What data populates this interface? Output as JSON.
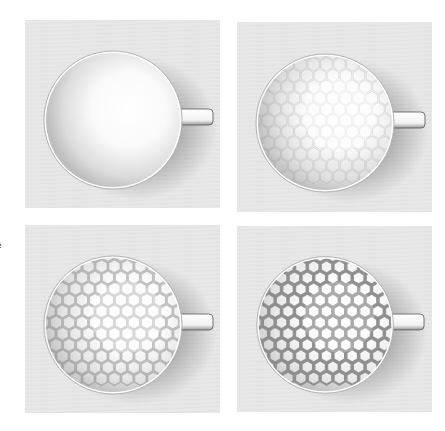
{
  "figure": {
    "edge_text_fragment": "e",
    "panels": [
      {
        "id": "plain",
        "pattern_strength": 0.0
      },
      {
        "id": "faint-hex",
        "pattern_strength": 0.25
      },
      {
        "id": "medium-hex",
        "pattern_strength": 0.55
      },
      {
        "id": "strong-hex",
        "pattern_strength": 1.0
      }
    ],
    "colors": {
      "background": "#e6e6e6",
      "cup_white": "#ffffff",
      "shadow": "#5a5a5a",
      "hex_line": "#8a8a8a"
    }
  }
}
